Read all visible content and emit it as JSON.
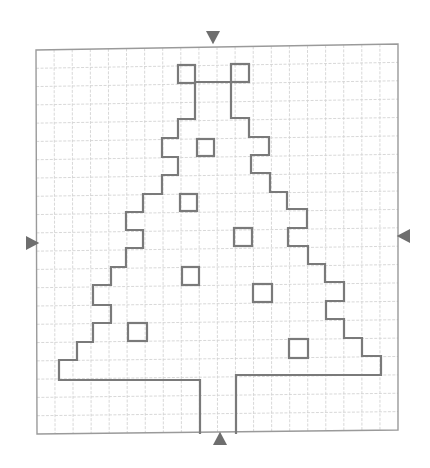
{
  "diagram": {
    "grid": {
      "columns": 20,
      "rows": 21,
      "corners": {
        "tl": [
          36,
          50
        ],
        "tr": [
          398,
          44
        ],
        "br": [
          398,
          430
        ],
        "bl": [
          37,
          434
        ]
      },
      "line_color": "#d4d4d4",
      "border_color": "#9a9a9a"
    },
    "outline_color": "#7a7a7a",
    "marker_color": "#6e6e6e",
    "tree_outline": [
      [
        195,
        83
      ],
      [
        195,
        119
      ],
      [
        178,
        119
      ],
      [
        178,
        138
      ],
      [
        162,
        138
      ],
      [
        162,
        157
      ],
      [
        178,
        157
      ],
      [
        178,
        175
      ],
      [
        162,
        175
      ],
      [
        162,
        194
      ],
      [
        143,
        194
      ],
      [
        143,
        212
      ],
      [
        126,
        212
      ],
      [
        126,
        230
      ],
      [
        143,
        230
      ],
      [
        143,
        248
      ],
      [
        126,
        248
      ],
      [
        126,
        267
      ],
      [
        111,
        267
      ],
      [
        111,
        285
      ],
      [
        93,
        285
      ],
      [
        93,
        305
      ],
      [
        111,
        305
      ],
      [
        111,
        323
      ],
      [
        93,
        323
      ],
      [
        93,
        342
      ],
      [
        77,
        342
      ],
      [
        77,
        360
      ],
      [
        59,
        360
      ],
      [
        59,
        380
      ],
      [
        200,
        380
      ],
      [
        200,
        434
      ]
    ],
    "tree_outline_right": [
      [
        231,
        82
      ],
      [
        231,
        118
      ],
      [
        249,
        118
      ],
      [
        249,
        137
      ],
      [
        269,
        137
      ],
      [
        269,
        155
      ],
      [
        251,
        155
      ],
      [
        251,
        173
      ],
      [
        270,
        173
      ],
      [
        270,
        192
      ],
      [
        287,
        192
      ],
      [
        287,
        209
      ],
      [
        307,
        209
      ],
      [
        307,
        228
      ],
      [
        288,
        228
      ],
      [
        288,
        246
      ],
      [
        308,
        246
      ],
      [
        308,
        264
      ],
      [
        325,
        264
      ],
      [
        325,
        282
      ],
      [
        344,
        282
      ],
      [
        344,
        301
      ],
      [
        326,
        301
      ],
      [
        326,
        319
      ],
      [
        344,
        319
      ],
      [
        344,
        338
      ],
      [
        362,
        338
      ],
      [
        362,
        356
      ],
      [
        381,
        356
      ],
      [
        381,
        375
      ],
      [
        236,
        375
      ],
      [
        236,
        434
      ]
    ],
    "top_connector": [
      [
        195,
        82
      ],
      [
        231,
        82
      ]
    ],
    "top_boxes": [
      {
        "x": 178,
        "y": 65,
        "w": 17,
        "h": 18
      },
      {
        "x": 231,
        "y": 64,
        "w": 18,
        "h": 18
      }
    ],
    "ornaments": [
      {
        "x": 197,
        "y": 139,
        "w": 17,
        "h": 17
      },
      {
        "x": 180,
        "y": 194,
        "w": 17,
        "h": 17
      },
      {
        "x": 234,
        "y": 228,
        "w": 18,
        "h": 18
      },
      {
        "x": 182,
        "y": 267,
        "w": 17,
        "h": 18
      },
      {
        "x": 253,
        "y": 284,
        "w": 19,
        "h": 18
      },
      {
        "x": 128,
        "y": 323,
        "w": 19,
        "h": 18
      },
      {
        "x": 289,
        "y": 339,
        "w": 19,
        "h": 19
      }
    ],
    "markers": [
      {
        "name": "top",
        "direction": "down",
        "x": 213,
        "y": 38
      },
      {
        "name": "left",
        "direction": "right",
        "x": 33,
        "y": 243
      },
      {
        "name": "right",
        "direction": "left",
        "x": 403,
        "y": 236
      },
      {
        "name": "bottom",
        "direction": "up",
        "x": 220,
        "y": 438
      }
    ]
  }
}
